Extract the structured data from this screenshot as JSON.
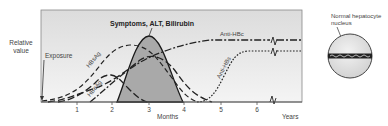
{
  "diagram": {
    "y_axis_label_line1": "Relative",
    "y_axis_label_line2": "value",
    "exposure_label": "Exposure",
    "peak_label": "Symptoms, ALT, Bilirubin",
    "x_axis_months_label": "Months",
    "x_axis_years_label": "Years",
    "tick_labels": [
      "1",
      "2",
      "3",
      "4",
      "5",
      "6"
    ],
    "curve_labels": {
      "hbsag": "HBsAg",
      "hbeag": "HBeAg",
      "anti_hbc": "Anti-HBc",
      "anti_hbs": "Anti-HBs"
    },
    "cell_label_line1": "Normal hepatocyte",
    "cell_label_line2": "nucleus"
  },
  "colors": {
    "plot_background": "#e6e6e6",
    "peak_fill": "#a9a9a9",
    "line": "#222222",
    "nucleus_fill": "#e2e2e2"
  }
}
